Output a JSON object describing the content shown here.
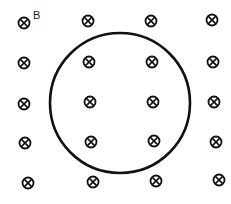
{
  "diagram": {
    "field_label": "B",
    "field_direction": "into-page",
    "symbol": "cross-in-circle",
    "colors": {
      "ink": "#111111",
      "background": "#ffffff"
    },
    "loop": {
      "shape": "circle",
      "cx": 120,
      "cy": 103,
      "r": 70
    },
    "field_symbols": [
      [
        24,
        23
      ],
      [
        88,
        21
      ],
      [
        151,
        21
      ],
      [
        212,
        20
      ],
      [
        24,
        63
      ],
      [
        89,
        62
      ],
      [
        152,
        62
      ],
      [
        213,
        62
      ],
      [
        24,
        104
      ],
      [
        90,
        102
      ],
      [
        153,
        102
      ],
      [
        214,
        102
      ],
      [
        25,
        143
      ],
      [
        91,
        142
      ],
      [
        154,
        141
      ],
      [
        216,
        142
      ],
      [
        28,
        183
      ],
      [
        93,
        182
      ],
      [
        156,
        181
      ],
      [
        219,
        180
      ]
    ]
  }
}
